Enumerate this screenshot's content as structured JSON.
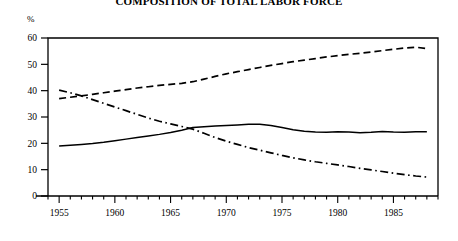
{
  "chart_data": {
    "type": "line",
    "title": "COMPOSITION OF TOTAL LABOR FORCE",
    "xlabel": "",
    "ylabel": "%",
    "unit_label": "%",
    "xlim": [
      1954,
      1989
    ],
    "ylim": [
      0,
      60
    ],
    "yticks": [
      0,
      10,
      20,
      30,
      40,
      50,
      60
    ],
    "ytick_labels": [
      "0",
      "10",
      "20",
      "30",
      "40",
      "50",
      "60"
    ],
    "xticks": [
      1955,
      1960,
      1965,
      1970,
      1975,
      1980,
      1985
    ],
    "xtick_labels": [
      "1955",
      "1960",
      "1965",
      "1970",
      "1975",
      "1980",
      "1985"
    ],
    "x_minor_tick_interval": 1,
    "grid": false,
    "legend": "none",
    "x": [
      1955,
      1956,
      1957,
      1958,
      1959,
      1960,
      1961,
      1962,
      1963,
      1964,
      1965,
      1966,
      1967,
      1968,
      1969,
      1970,
      1971,
      1972,
      1973,
      1974,
      1975,
      1976,
      1977,
      1978,
      1979,
      1980,
      1981,
      1982,
      1983,
      1984,
      1985,
      1986,
      1987,
      1988
    ],
    "series": [
      {
        "name": "series-dashed",
        "style": "dashed",
        "values": [
          37.0,
          37.5,
          38.0,
          38.6,
          39.2,
          39.8,
          40.4,
          41.0,
          41.5,
          42.0,
          42.4,
          42.8,
          43.4,
          44.4,
          45.4,
          46.4,
          47.2,
          48.0,
          48.8,
          49.6,
          50.3,
          51.0,
          51.6,
          52.2,
          52.8,
          53.3,
          53.8,
          54.2,
          54.7,
          55.2,
          55.7,
          56.2,
          56.5,
          56.0
        ]
      },
      {
        "name": "series-solid",
        "style": "solid",
        "values": [
          19.0,
          19.3,
          19.6,
          19.9,
          20.4,
          21.0,
          21.6,
          22.2,
          22.8,
          23.4,
          24.1,
          25.0,
          26.0,
          26.3,
          26.6,
          26.8,
          27.0,
          27.2,
          27.2,
          26.8,
          26.0,
          25.2,
          24.6,
          24.3,
          24.2,
          24.4,
          24.3,
          24.0,
          24.2,
          24.5,
          24.3,
          24.2,
          24.4,
          24.4
        ]
      },
      {
        "name": "series-dash-dot",
        "style": "dash-dot",
        "values": [
          40.2,
          39.2,
          38.0,
          36.6,
          35.2,
          33.8,
          32.4,
          31.0,
          29.6,
          28.4,
          27.4,
          26.4,
          25.4,
          23.8,
          22.2,
          20.8,
          19.6,
          18.4,
          17.4,
          16.4,
          15.4,
          14.5,
          13.7,
          13.0,
          12.4,
          11.8,
          11.2,
          10.5,
          9.9,
          9.3,
          8.7,
          8.1,
          7.6,
          7.2
        ]
      }
    ]
  }
}
